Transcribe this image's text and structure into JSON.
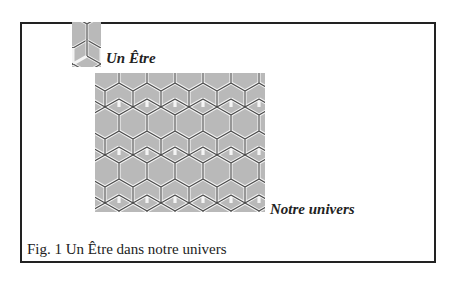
{
  "figure": {
    "labels": {
      "being": "Un Être",
      "universe": "Notre univers"
    },
    "caption": "Fig. 1  Un Être dans notre univers",
    "colors": {
      "frame": "#222222",
      "hex_fill": "#b9b9b9",
      "hex_edge_light": "#f2f2f2",
      "hex_edge_dark": "#555555"
    }
  }
}
